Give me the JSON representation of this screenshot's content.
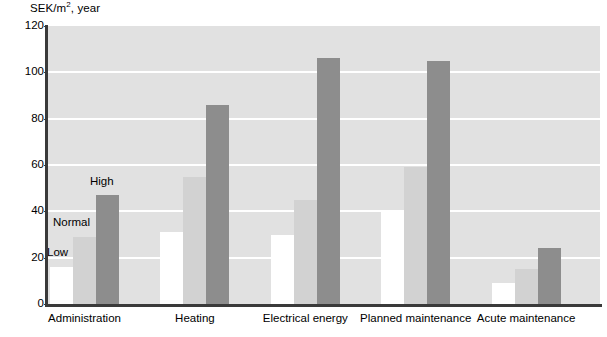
{
  "chart_data": {
    "type": "bar",
    "title_prefix": "SEK/m",
    "title_sup": "2",
    "title_suffix": ", year",
    "xlabel": "",
    "ylabel": "SEK/m², year",
    "ylim": [
      0,
      120
    ],
    "ytick_labels": [
      "0",
      "20",
      "40",
      "60",
      "80",
      "100",
      "120"
    ],
    "yticks": [
      0,
      20,
      40,
      60,
      80,
      100,
      120
    ],
    "grid": "horizontal-white",
    "legend_position": "inline-annotations-first-group",
    "categories": [
      "Administration",
      "Heating",
      "Electrical energy",
      "Planned maintenance",
      "Acute maintenance"
    ],
    "series": [
      {
        "name": "Low",
        "color": "#ffffff",
        "values": [
          16,
          31,
          30,
          40,
          9
        ]
      },
      {
        "name": "Normal",
        "color": "#d2d2d2",
        "values": [
          29,
          55,
          45,
          59,
          15
        ]
      },
      {
        "name": "High",
        "color": "#8d8d8d",
        "values": [
          47,
          86,
          106,
          105,
          24
        ]
      }
    ],
    "annotations": [
      {
        "text": "Low",
        "series": "Low",
        "category": "Administration"
      },
      {
        "text": "Normal",
        "series": "Normal",
        "category": "Administration"
      },
      {
        "text": "High",
        "series": "High",
        "category": "Administration"
      }
    ],
    "colors": {
      "plot_background": "#e1e1e1",
      "gridline": "#ffffff",
      "axis": "#3a3a3a",
      "text": "#000000"
    }
  }
}
